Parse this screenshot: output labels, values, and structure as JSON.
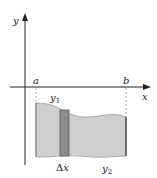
{
  "diagram": {
    "type": "area-between-curves",
    "axes": {
      "x_label": "x",
      "y_label": "y"
    },
    "bounds": {
      "left_label": "a",
      "right_label": "b"
    },
    "curves": {
      "upper_label": "y",
      "upper_subscript": "1",
      "lower_label": "y",
      "lower_subscript": "2"
    },
    "strip": {
      "label_delta": "Δ",
      "label_var": "x"
    },
    "colors": {
      "axis": "#222222",
      "region_fill": "#cfcfcf",
      "region_edge": "#8a8a8a",
      "strip_fill": "#8c8c8c",
      "strip_edge": "#5a5a5a",
      "dashed": "#999999"
    }
  }
}
